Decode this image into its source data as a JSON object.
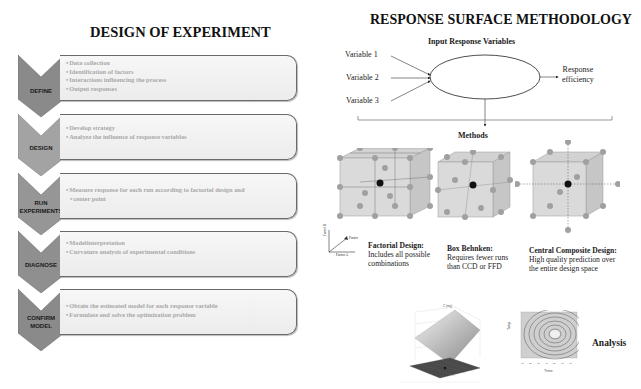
{
  "left_panel": {
    "title": "DESIGN OF EXPERIMENT",
    "steps": [
      {
        "label_lines": [
          "DEFINE"
        ],
        "bullets": [
          "Data collection",
          "Identification of factors",
          "Interactions influencing the process",
          "Output responses"
        ],
        "chevron_color": "#8a8a8a"
      },
      {
        "label_lines": [
          "DESIGN"
        ],
        "bullets": [
          "Develop strategy",
          "Analyze  the influence of response variables"
        ],
        "chevron_color": "#a3a3a3"
      },
      {
        "label_lines": [
          "RUN",
          "EXPERIMENTS"
        ],
        "bullets": [
          "Measure response for each run according to factorial design and",
          "center point"
        ],
        "chevron_color": "#969696"
      },
      {
        "label_lines": [
          "DIAGNOSE"
        ],
        "bullets": [
          "Modelinterpretation",
          "Curvature analysis of experimental conditions"
        ],
        "chevron_color": "#8f8f8f"
      },
      {
        "label_lines": [
          "CONFIRM",
          "MODEL"
        ],
        "bullets": [
          "Obtain the estimated model for each response variable",
          "Formulate and solve the optimization  problem"
        ],
        "chevron_color": "#8a8a8a"
      }
    ]
  },
  "right_panel": {
    "title": "RESPONSE SURFACE METHODOLOGY",
    "input_heading": "Input Response Variables",
    "variables": [
      "Variable  1",
      "Variable  2",
      "Variable  3"
    ],
    "output": [
      "Response",
      "efficiency"
    ],
    "methods_heading": "Methods",
    "axis_labels": {
      "y": "Factor B",
      "z": "Factor",
      "x": "Factor A"
    },
    "methods": [
      {
        "name": "Factorial Design:",
        "desc": [
          "Includes all possible",
          "combinations"
        ]
      },
      {
        "name": "Box Behnken:",
        "desc": [
          "Requires fewer runs",
          "than CCD or FFD"
        ]
      },
      {
        "name": "Central Composite Design:",
        "desc": [
          "High quality prediction over",
          "the entire design space"
        ]
      }
    ],
    "analysis_label": "Analysis",
    "contour_axis": {
      "x": "Time",
      "y": "Temp"
    }
  }
}
